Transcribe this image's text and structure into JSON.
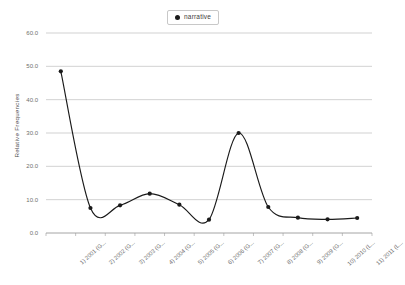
{
  "chart_data": {
    "type": "line",
    "title": "",
    "xlabel": "",
    "ylabel": "Relative Frequencies",
    "ylim": [
      0.0,
      60.0
    ],
    "ytick_labels": [
      "60.0",
      "50.0",
      "40.0",
      "30.0",
      "20.0",
      "10.0",
      "0.0"
    ],
    "ytick_values": [
      60.0,
      50.0,
      40.0,
      30.0,
      20.0,
      10.0,
      0.0
    ],
    "grid": true,
    "legend_position": "top-center",
    "categories": [
      "1) 2001 (G...",
      "2) 2002 (G...",
      "3) 2003 (G...",
      "4) 2004 (G...",
      "5) 2005 (G...",
      "6) 2006 (G...",
      "7) 2007 (G...",
      "8) 2008 (G...",
      "9) 2009 (G...",
      "10) 2010 (L...",
      "11) 2011 (L..."
    ],
    "series": [
      {
        "name": "narrative",
        "marker": "filled-circle",
        "color": "#1a1a1a",
        "smoothing": "spline",
        "values": [
          48.5,
          7.5,
          8.3,
          11.8,
          8.5,
          4.0,
          30.0,
          7.8,
          4.6,
          4.1,
          4.5
        ]
      }
    ]
  },
  "legend": {
    "entries": [
      {
        "label": "narrative",
        "marker_color": "#1a1a1a"
      }
    ]
  },
  "colors": {
    "line": "#1a1a1a",
    "grid": "#b4b4b4",
    "axis": "#9a9a9a",
    "text": "#6e6e6e",
    "background": "#ffffff"
  }
}
